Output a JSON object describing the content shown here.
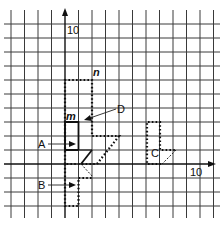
{
  "diagram": {
    "type": "coordinate-grid-transformations",
    "grid": {
      "cell_size_px": 13.6,
      "x_origin_px": 65,
      "y_origin_px": 164,
      "vertical_lines_px": [
        11,
        24.5,
        38,
        51.5,
        65,
        78.5,
        92,
        105.5,
        119,
        132.5,
        146,
        159.5,
        173,
        186.5,
        200,
        213.5
      ],
      "horizontal_lines_px": [
        24,
        38,
        52,
        66,
        80,
        94,
        108,
        122,
        136,
        150,
        164,
        178,
        192,
        206
      ],
      "line_color": "#3a3a3a"
    },
    "axes": {
      "x_axis_tick_label": "10",
      "y_axis_tick_label": "10"
    },
    "shapes": {
      "m": {
        "label": "m",
        "style": "solid",
        "description": "Solid arrow shape: rectangle with a triangular tip pointing down-right"
      },
      "n": {
        "label": "n",
        "style": "dotted",
        "description": "Dotted enlarged arrow shape (enlargement of m)"
      },
      "A": {
        "label": "A",
        "style": "dotted",
        "description": "Dotted shape overlapping m along the y-axis"
      },
      "B": {
        "label": "B",
        "style": "dotted",
        "description": "Dotted reflected shape below the x-axis"
      },
      "C": {
        "label": "C",
        "style": "dotted",
        "description": "Dotted translated shape to the right"
      },
      "D": {
        "label": "D",
        "style": "pointer",
        "description": "Pointer labelling a shape near m"
      }
    },
    "colors": {
      "ink": "#111111",
      "background": "#ffffff"
    }
  }
}
